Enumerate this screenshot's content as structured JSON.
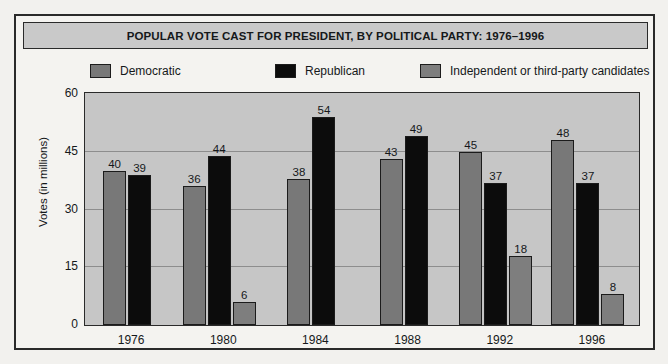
{
  "title": "POPULAR VOTE CAST FOR PRESIDENT, BY POLITICAL PARTY: 1976–1996",
  "legend": [
    {
      "label": "Democratic",
      "color": "#787878",
      "swatch_name": "legend-swatch-democratic"
    },
    {
      "label": "Republican",
      "color": "#0c0c0c",
      "swatch_name": "legend-swatch-republican"
    },
    {
      "label": "Independent or third-party candidates",
      "color": "#7e7e7e",
      "swatch_name": "legend-swatch-independent"
    }
  ],
  "chart_data": {
    "type": "bar",
    "title": "POPULAR VOTE CAST FOR PRESIDENT, BY POLITICAL PARTY: 1976–1996",
    "xlabel": "",
    "ylabel": "Votes (in millions)",
    "categories": [
      "1976",
      "1980",
      "1984",
      "1988",
      "1992",
      "1996"
    ],
    "ylim": [
      0,
      60
    ],
    "yticks": [
      0,
      15,
      30,
      45,
      60
    ],
    "grid": true,
    "legend_position": "top",
    "series": [
      {
        "name": "Democratic",
        "color": "#787878",
        "values": [
          40,
          36,
          38,
          43,
          45,
          48
        ]
      },
      {
        "name": "Republican",
        "color": "#0c0c0c",
        "values": [
          39,
          44,
          54,
          49,
          37,
          37
        ]
      },
      {
        "name": "Independent or third-party candidates",
        "color": "#7e7e7e",
        "values": [
          null,
          6,
          null,
          null,
          18,
          8
        ]
      }
    ],
    "data_labels": {
      "1976": {
        "Democratic": "40",
        "Republican": "39",
        "Independent or third-party candidates": ""
      },
      "1980": {
        "Democratic": "36",
        "Republican": "44",
        "Independent or third-party candidates": "6"
      },
      "1984": {
        "Democratic": "38",
        "Republican": "54",
        "Independent or third-party candidates": ""
      },
      "1988": {
        "Democratic": "43",
        "Republican": "49",
        "Independent or third-party candidates": ""
      },
      "1992": {
        "Democratic": "45",
        "Republican": "37",
        "Independent or third-party candidates": "18"
      },
      "1996": {
        "Democratic": "48",
        "Republican": "37",
        "Independent or third-party candidates": "8"
      }
    }
  }
}
